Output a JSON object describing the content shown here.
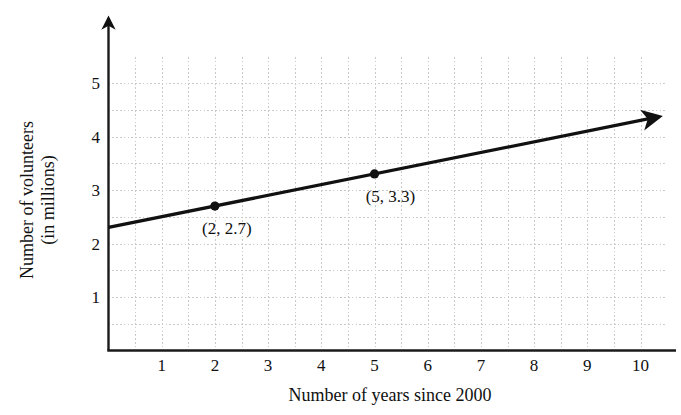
{
  "chart_data": {
    "type": "line",
    "title": "",
    "xlabel": "Number of years since 2000",
    "ylabel_line1": "Number of volunteers",
    "ylabel_line2": "(in millions)",
    "ylabel": "Number of volunteers (in millions)",
    "xlim": [
      0,
      10.5
    ],
    "ylim": [
      0,
      5.5
    ],
    "xticks": [
      1,
      2,
      3,
      4,
      5,
      6,
      7,
      8,
      9,
      10
    ],
    "xtick_labels": [
      "1",
      "2",
      "3",
      "4",
      "5",
      "6",
      "7",
      "8",
      "9",
      "10"
    ],
    "yticks": [
      1,
      2,
      3,
      4,
      5
    ],
    "ytick_labels": [
      "1",
      "2",
      "3",
      "4",
      "5"
    ],
    "grid": true,
    "grid_style": "dotted",
    "grid_spacing": 0.5,
    "grid_color": "#c9c9c9",
    "legend": "none",
    "line_color": "#000000",
    "line_width": 3,
    "arrow_end": true,
    "series": [
      {
        "name": "volunteers",
        "slope": 0.2,
        "intercept": 2.3,
        "x": [
          0,
          10.5
        ],
        "values": [
          2.3,
          4.4
        ]
      }
    ],
    "points": [
      {
        "x": 2,
        "y": 2.7,
        "label": "(2, 2.7)"
      },
      {
        "x": 5,
        "y": 3.3,
        "label": "(5, 3.3)"
      }
    ],
    "axis_color": "#1a1a1a",
    "background": "#ffffff"
  },
  "axes": {
    "y_arrow_icon": "arrow-up-icon",
    "line_arrow_icon": "arrow-right-icon"
  }
}
